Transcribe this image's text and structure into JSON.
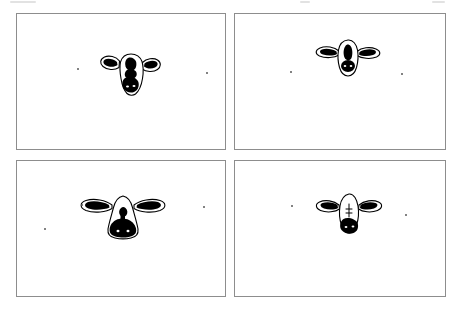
{
  "figure": {
    "layout": "2x2 grid of bordered panels",
    "background_color": "#ffffff",
    "ink_color": "#000000",
    "border_color": "#8d8d8d",
    "panel_count": 4
  },
  "panels": [
    {
      "id": "panel-top-left",
      "position": "top-left",
      "caption": "1",
      "subject": "cow-head-front-view",
      "description": "Cow head with rounded drooping ears, large dark blaze patch down the face and dark muzzle",
      "frame": {
        "x": 16,
        "y": 13,
        "w": 210,
        "h": 137
      },
      "art": {
        "x": 80,
        "y": 33,
        "w": 68,
        "h": 52
      },
      "specks": [
        {
          "x": 60,
          "y": 54,
          "r": 1.1
        },
        {
          "x": 189,
          "y": 58,
          "r": 1.1
        }
      ]
    },
    {
      "id": "panel-top-right",
      "position": "top-right",
      "caption": "2",
      "subject": "cow-head-front-view",
      "description": "Smaller cow head with horizontal pointed ears, dark nose bridge stripe and solid black muzzle",
      "frame": {
        "x": 234,
        "y": 13,
        "w": 212,
        "h": 137
      },
      "art": {
        "x": 78,
        "y": 22,
        "w": 70,
        "h": 46
      },
      "specks": [
        {
          "x": 55,
          "y": 57,
          "r": 1.1
        },
        {
          "x": 166,
          "y": 59,
          "r": 1.1
        }
      ]
    },
    {
      "id": "panel-bottom-left",
      "position": "bottom-left",
      "caption": "3",
      "subject": "cow-head-front-view",
      "description": "Cow head with long wide horizontal ears filled black and a bell-shaped face with dark muzzle",
      "frame": {
        "x": 16,
        "y": 160,
        "w": 210,
        "h": 137
      },
      "art": {
        "x": 63,
        "y": 30,
        "w": 86,
        "h": 52
      },
      "specks": [
        {
          "x": 64,
          "y": 43,
          "r": 1.0
        },
        {
          "x": 27,
          "y": 67,
          "r": 1.1
        },
        {
          "x": 186,
          "y": 45,
          "r": 1.0
        }
      ]
    },
    {
      "id": "panel-bottom-right",
      "position": "bottom-right",
      "caption": "4",
      "subject": "cow-head-front-view",
      "description": "Cow head with white face, triangular black ear patches and a broad black muzzle",
      "frame": {
        "x": 234,
        "y": 160,
        "w": 212,
        "h": 137
      },
      "art": {
        "x": 80,
        "y": 30,
        "w": 68,
        "h": 48
      },
      "specks": [
        {
          "x": 56,
          "y": 44,
          "r": 1.0
        },
        {
          "x": 170,
          "y": 53,
          "r": 1.0
        }
      ]
    }
  ],
  "scan_artifacts": {
    "top_specks": [
      {
        "x": 10,
        "y": 2,
        "w": 26,
        "h": 3
      },
      {
        "x": 300,
        "y": 1,
        "w": 10,
        "h": 3
      },
      {
        "x": 432,
        "y": 2,
        "w": 14,
        "h": 3
      }
    ]
  }
}
